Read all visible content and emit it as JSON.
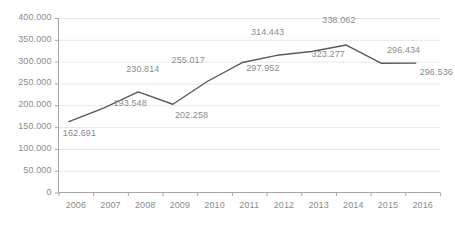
{
  "chart_data": {
    "type": "line",
    "title": "",
    "subtitle": "",
    "xlabel": "",
    "ylabel": "",
    "categories": [
      "2006",
      "2007",
      "2008",
      "2009",
      "2010",
      "2011",
      "2012",
      "2013",
      "2014",
      "2015",
      "2016"
    ],
    "series": [
      {
        "name": "",
        "values": [
          162.691,
          193.548,
          230.814,
          202.258,
          255.017,
          297.952,
          314.443,
          323.277,
          338.062,
          296.434,
          296.536
        ]
      }
    ],
    "point_labels": [
      "162.691",
      "193.548",
      "230.814",
      "202.258",
      "255.017",
      "297.952",
      "314.443",
      "323.277",
      "338.062",
      "296.434",
      "296.536"
    ],
    "ylim": [
      0,
      400
    ],
    "ytick_values": [
      400,
      350,
      300,
      250,
      200,
      150,
      100,
      50,
      0
    ],
    "ytick_labels": [
      "400.000",
      "350.000",
      "300.000",
      "250.000",
      "200.000",
      "150.000",
      "100.000",
      "50.000",
      "0"
    ],
    "grid": true,
    "legend": "none",
    "line_color": "#595959",
    "grid_color": "#e8e8e8",
    "axis_color": "#a6a6a6",
    "label_color": "#8c8c8c"
  }
}
